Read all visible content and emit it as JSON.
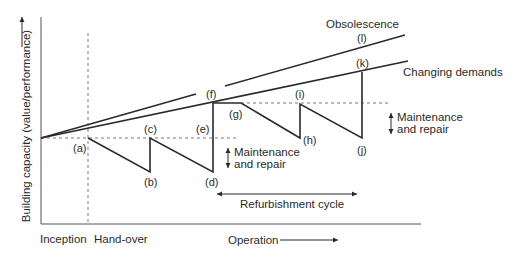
{
  "diagram": {
    "y_axis_label": "Building capacity (value/performance)",
    "x_labels": {
      "inception": "Inception",
      "handover": "Hand-over",
      "operation": "Operation"
    },
    "curves": {
      "obsolescence": "Obsolescence",
      "changing_demands": "Changing demands"
    },
    "annotations": {
      "maintenance_1_line1": "Maintenance",
      "maintenance_1_line2": "and repair",
      "maintenance_2_line1": "Maintenance",
      "maintenance_2_line2": "and repair",
      "refurbishment": "Refurbishment cycle"
    },
    "points": {
      "a": "(a)",
      "b": "(b)",
      "c": "(c)",
      "d": "(d)",
      "e": "(e)",
      "f": "(f)",
      "g": "(g)",
      "h": "(h)",
      "i": "(i)",
      "j": "(j)",
      "k": "(k)",
      "l": "(l)"
    },
    "colors": {
      "line": "#2a2a2a",
      "dashed": "#7a7a7a"
    }
  }
}
